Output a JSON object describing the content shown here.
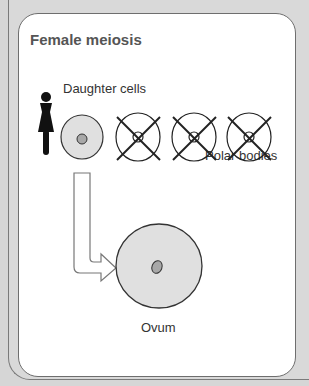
{
  "diagram": {
    "title": "Female meiosis",
    "labels": {
      "daughter_cells": "Daughter cells",
      "polar_bodies": "Polar bodies",
      "ovum": "Ovum"
    },
    "icons": [
      "female-symbol-icon",
      "cell-icon",
      "polar-body-crossed-icon",
      "arrow-icon",
      "ovum-icon"
    ],
    "colors": {
      "cell_fill": "#e0e0e0",
      "nucleus_fill": "#a8a8a8",
      "outline": "#333333",
      "panel_bg": "#d9d9d9"
    },
    "polar_body_count": 3
  }
}
